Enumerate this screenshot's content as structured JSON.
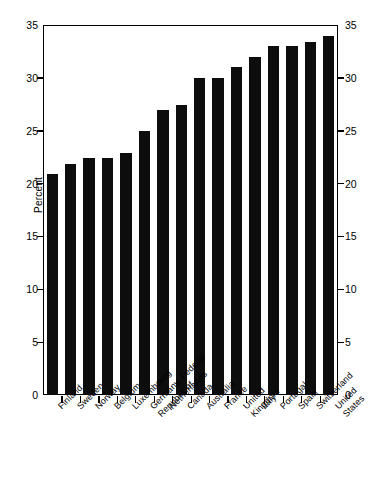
{
  "chart_data": {
    "type": "bar",
    "title": "",
    "subtitle": "",
    "xlabel": "",
    "ylabel": "Percent",
    "ylim": [
      0,
      35
    ],
    "yticks": [
      0,
      5,
      10,
      15,
      20,
      25,
      30,
      35
    ],
    "ytick_labels": [
      "0",
      "5",
      "10",
      "15",
      "20",
      "25",
      "30",
      "35"
    ],
    "right_axis": {
      "visible": true,
      "ylim": [
        0,
        35
      ],
      "yticks": [
        0,
        5,
        10,
        15,
        20,
        25,
        30,
        35
      ],
      "ytick_labels": [
        "0",
        "5",
        "10",
        "15",
        "20",
        "25",
        "30",
        "35"
      ]
    },
    "grid": false,
    "legend": null,
    "bar_color": "#0d0d0d",
    "categories": [
      "Finland",
      "Sweden",
      "Norway",
      "Belgium",
      "Luxembourg",
      "Germany, Federal Republic of",
      "Netherlands",
      "Canada",
      "Australia",
      "France",
      "United Kingdom",
      "Italy",
      "Portugal",
      "Spain",
      "Switzerland",
      "United States"
    ],
    "categories_display": [
      {
        "l1": "Finland",
        "l2": ""
      },
      {
        "l1": "Sweden",
        "l2": ""
      },
      {
        "l1": "Norway",
        "l2": ""
      },
      {
        "l1": "Belgium",
        "l2": ""
      },
      {
        "l1": "Luxembourg",
        "l2": ""
      },
      {
        "l1": "Germany, Federal",
        "l2": "Republic of"
      },
      {
        "l1": "Netherlands",
        "l2": ""
      },
      {
        "l1": "Canada",
        "l2": ""
      },
      {
        "l1": "Australia",
        "l2": ""
      },
      {
        "l1": "France",
        "l2": ""
      },
      {
        "l1": "United",
        "l2": "Kingdom"
      },
      {
        "l1": "Italy",
        "l2": ""
      },
      {
        "l1": "Portugal",
        "l2": ""
      },
      {
        "l1": "Spain",
        "l2": ""
      },
      {
        "l1": "Switzerland",
        "l2": ""
      },
      {
        "l1": "United",
        "l2": "States"
      }
    ],
    "values": [
      20.9,
      21.9,
      22.4,
      22.4,
      22.9,
      25.0,
      27.0,
      27.4,
      30.0,
      30.0,
      31.0,
      32.0,
      33.0,
      33.0,
      33.4,
      34.0
    ],
    "bar_count": 17,
    "values_all": [
      20.9,
      21.9,
      22.4,
      22.4,
      22.9,
      25.0,
      27.0,
      27.4,
      30.0,
      30.0,
      31.0,
      32.0,
      33.0,
      33.0,
      33.4,
      34.0
    ]
  }
}
